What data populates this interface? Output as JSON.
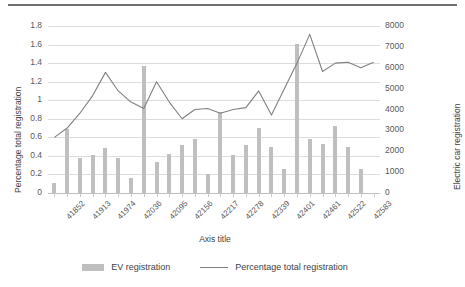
{
  "chart_data": {
    "type": "bar",
    "title": "",
    "subtitle": "",
    "xlabel": "Axis title",
    "ylabel": "Percentage total registration",
    "ylabel_secondary": "Electric car registration",
    "ylim": [
      0,
      1.8
    ],
    "ylim_secondary": [
      0,
      8000
    ],
    "ytick_labels": [
      "0",
      "0.2",
      "0.4",
      "0.6",
      "0.8",
      "1",
      "1.2",
      "1.4",
      "1.6",
      "1.8"
    ],
    "ytick_values": [
      0,
      0.2,
      0.4,
      0.6,
      0.8,
      1.0,
      1.2,
      1.4,
      1.6,
      1.8
    ],
    "ytick_labels_secondary": [
      "0",
      "1000",
      "2000",
      "3000",
      "4000",
      "5000",
      "6000",
      "7000",
      "8000"
    ],
    "ytick_values_secondary": [
      0,
      1000,
      2000,
      3000,
      4000,
      5000,
      6000,
      7000,
      8000
    ],
    "grid": true,
    "legend_position": "bottom",
    "categories": [
      "41852",
      "41883",
      "41913",
      "41944",
      "41974",
      "42005",
      "42036",
      "42064",
      "42095",
      "42125",
      "42156",
      "42186",
      "42217",
      "42248",
      "42278",
      "42309",
      "42339",
      "42370",
      "42401",
      "42430",
      "42461",
      "42491",
      "42522",
      "42552",
      "42583",
      "42614"
    ],
    "xtick_labels_shown": [
      "41852",
      "41913",
      "41974",
      "42036",
      "42095",
      "42156",
      "42217",
      "42278",
      "42339",
      "42401",
      "42461",
      "42522",
      "42583"
    ],
    "series": [
      {
        "name": "EV registration",
        "type": "bar",
        "axis": "secondary",
        "color": "#bfbfbf",
        "values": [
          500,
          3050,
          1700,
          1830,
          2160,
          1700,
          740,
          6100,
          1470,
          1870,
          2290,
          2600,
          900,
          3870,
          1840,
          2290,
          3110,
          2190,
          1170,
          7150,
          2580,
          2350,
          3230,
          2220,
          1160,
          0
        ]
      },
      {
        "name": "Percentage total registration",
        "type": "line",
        "axis": "primary",
        "color": "#808080",
        "values": [
          0.6,
          0.7,
          0.86,
          1.05,
          1.3,
          1.1,
          0.98,
          0.91,
          1.2,
          0.98,
          0.8,
          0.9,
          0.91,
          0.86,
          0.9,
          0.92,
          1.1,
          0.84,
          1.12,
          1.4,
          1.71,
          1.31,
          1.4,
          1.41,
          1.35,
          1.41
        ]
      }
    ],
    "legend": [
      {
        "label": "EV registration",
        "marker": "bar-swatch",
        "color": "#bfbfbf"
      },
      {
        "label": "Percentage total registration",
        "marker": "line-swatch",
        "color": "#808080"
      }
    ]
  }
}
